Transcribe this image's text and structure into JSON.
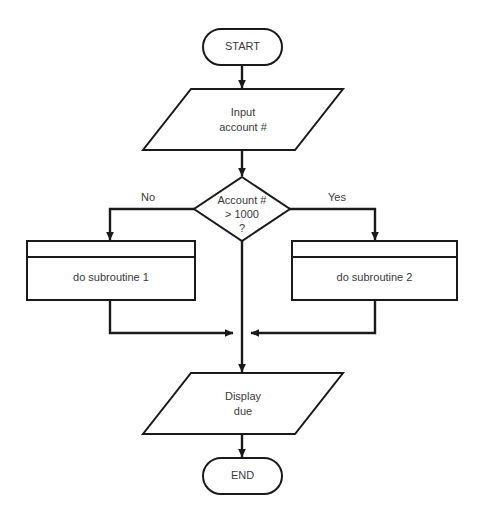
{
  "diagram": {
    "type": "flowchart",
    "background_color": "#ffffff",
    "line_color": "#1a1a1a",
    "text_color": "#3a3a3a"
  },
  "nodes": {
    "start": {
      "shape": "terminator",
      "label": "START"
    },
    "input": {
      "shape": "parallelogram",
      "label_line1": "Input",
      "label_line2": "account #"
    },
    "decision": {
      "shape": "diamond",
      "label_line1": "Account #",
      "label_line2": "> 1000",
      "label_line3": "?"
    },
    "subroutine_left": {
      "shape": "predefined-process",
      "label": "do subroutine 1"
    },
    "subroutine_right": {
      "shape": "predefined-process",
      "label": "do subroutine 2"
    },
    "output": {
      "shape": "parallelogram",
      "label_line1": "Display",
      "label_line2": "due"
    },
    "end": {
      "shape": "terminator",
      "label": "END"
    }
  },
  "branches": {
    "no_label": "No",
    "yes_label": "Yes"
  }
}
